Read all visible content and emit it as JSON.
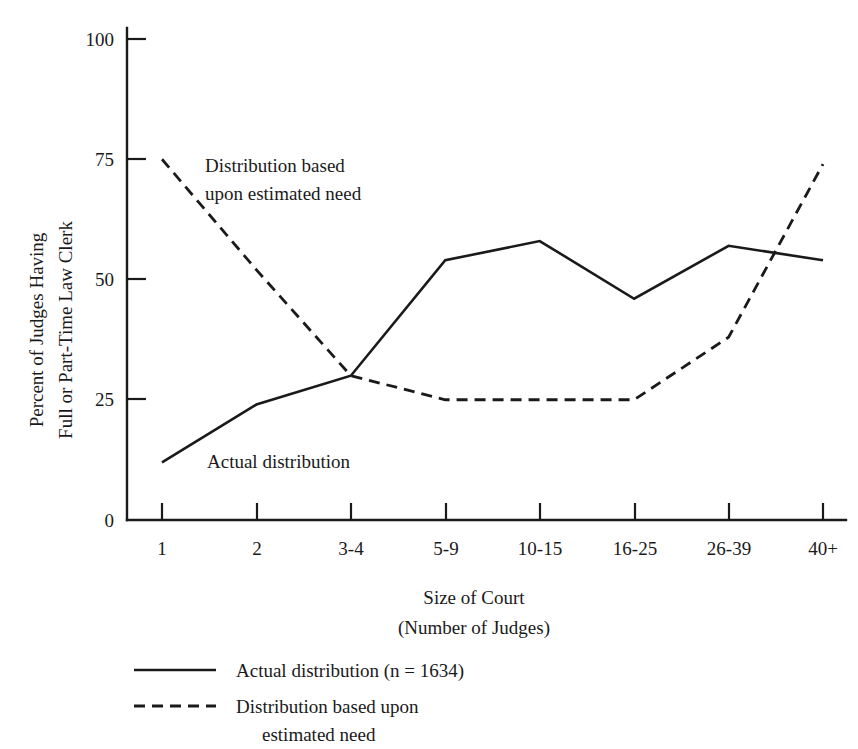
{
  "chart_data": {
    "type": "line",
    "title": "",
    "xlabel": "Size of Court\n(Number of Judges)",
    "xlabel_line1": "Size of Court",
    "xlabel_line2": "(Number of Judges)",
    "ylabel_line1": "Percent of Judges Having",
    "ylabel_line2": "Full or Part-Time Law Clerk",
    "categories": [
      "1",
      "2",
      "3-4",
      "5-9",
      "10-15",
      "16-25",
      "26-39",
      "40+"
    ],
    "ylim": [
      0,
      100
    ],
    "yticks": [
      "0",
      "25",
      "50",
      "75",
      "100"
    ],
    "ytick_values": [
      0,
      25,
      50,
      75,
      100
    ],
    "grid": false,
    "legend_position": "below-plot-left",
    "series": [
      {
        "name": "Actual distribution (n = 1634)",
        "style": "solid",
        "color": "#1a1a1a",
        "values": [
          12,
          24,
          30,
          54,
          58,
          46,
          57,
          54
        ]
      },
      {
        "name": "Distribution based upon estimated need",
        "style": "dashed",
        "color": "#1a1a1a",
        "values": [
          75,
          52,
          30,
          25,
          25,
          25,
          38,
          74
        ]
      }
    ],
    "annotations": [
      {
        "id": "annotation-estimated-need",
        "line1": "Distribution based",
        "line2": "upon estimated need",
        "x": 205,
        "y": 165
      },
      {
        "id": "annotation-actual",
        "line1": "Actual distribution",
        "line2": "",
        "x": 207,
        "y": 468
      }
    ],
    "legend": [
      {
        "label": "Actual distribution (n = 1634)",
        "label_line2": "",
        "style": "solid"
      },
      {
        "label": "Distribution based upon",
        "label_line2": "estimated need",
        "style": "dashed"
      }
    ]
  }
}
